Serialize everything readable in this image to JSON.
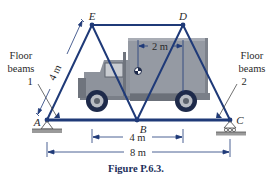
{
  "figure": {
    "caption": "Figure P.6.3.",
    "nodes": {
      "A": "A",
      "B": "B",
      "C": "C",
      "D": "D",
      "E": "E"
    },
    "labels": {
      "floor_beams_left_line1": "Floor",
      "floor_beams_left_line2": "beams",
      "floor_beams_left_num": "1",
      "floor_beams_right_line1": "Floor",
      "floor_beams_right_line2": "beams",
      "floor_beams_right_num": "2"
    },
    "dimensions": {
      "member_AE": "4 m",
      "truck_cg_offset": "2 m",
      "top_span_ED": "4 m",
      "total_span_AC": "8 m"
    },
    "colors": {
      "truss": "#1f3a78",
      "truck_body": "#8e939c",
      "truck_dark": "#5d636d",
      "dimension": "#1f3a78",
      "ground": "#9a9a9a"
    }
  }
}
